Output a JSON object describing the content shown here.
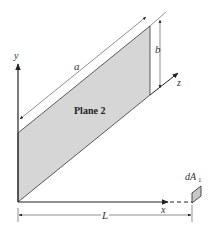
{
  "diagram": {
    "plane_label": "Plane 2",
    "axes": {
      "x": "x",
      "y": "y",
      "z": "z"
    },
    "dimensions": {
      "a": "a",
      "b": "b",
      "L": "L"
    },
    "element": {
      "label": "dA",
      "subscript": "1"
    },
    "colors": {
      "plane_fill": "#d6d6d6",
      "line": "#222222",
      "element_fill": "#c8c8c8"
    }
  }
}
